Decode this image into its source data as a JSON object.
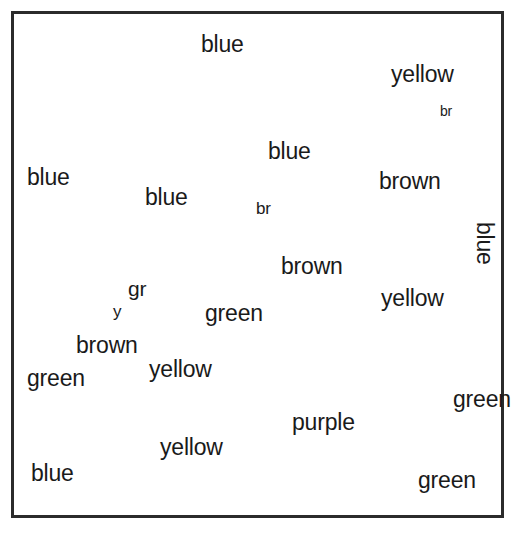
{
  "page": {
    "type": "color-by-word coloring page",
    "background_color": "#ffffff",
    "ink_color": "#1a1a1a",
    "frame_color": "#2b2b2b",
    "width": 529,
    "height": 533
  },
  "labels": [
    {
      "id": "sky-top",
      "text": "blue",
      "x": 201,
      "y": 33,
      "size": "lg",
      "rotated": false
    },
    {
      "id": "hat",
      "text": "yellow",
      "x": 391,
      "y": 63,
      "size": "lg",
      "rotated": false
    },
    {
      "id": "ear",
      "text": "br",
      "x": 440,
      "y": 104,
      "size": "xs",
      "rotated": false
    },
    {
      "id": "sky-head",
      "text": "blue",
      "x": 268,
      "y": 140,
      "size": "lg",
      "rotated": false
    },
    {
      "id": "face",
      "text": "brown",
      "x": 379,
      "y": 170,
      "size": "lg",
      "rotated": false
    },
    {
      "id": "sky-left",
      "text": "blue",
      "x": 27,
      "y": 166,
      "size": "lg",
      "rotated": false
    },
    {
      "id": "sky-mid",
      "text": "blue",
      "x": 145,
      "y": 186,
      "size": "lg",
      "rotated": false
    },
    {
      "id": "flute",
      "text": "br",
      "x": 256,
      "y": 200,
      "size": "sm",
      "rotated": false
    },
    {
      "id": "sky-right",
      "text": "blue",
      "x": 496,
      "y": 222,
      "size": "lg",
      "rotated": true
    },
    {
      "id": "paw-upper",
      "text": "brown",
      "x": 281,
      "y": 255,
      "size": "lg",
      "rotated": false
    },
    {
      "id": "ball-inner",
      "text": "gr",
      "x": 128,
      "y": 278,
      "size": "md",
      "rotated": false
    },
    {
      "id": "ball-core",
      "text": "y",
      "x": 113,
      "y": 303,
      "size": "sm",
      "rotated": false
    },
    {
      "id": "arm",
      "text": "yellow",
      "x": 381,
      "y": 287,
      "size": "lg",
      "rotated": false
    },
    {
      "id": "bush-mid",
      "text": "green",
      "x": 205,
      "y": 302,
      "size": "lg",
      "rotated": false
    },
    {
      "id": "ball-outer",
      "text": "brown",
      "x": 76,
      "y": 334,
      "size": "lg",
      "rotated": false
    },
    {
      "id": "grass-left",
      "text": "green",
      "x": 27,
      "y": 367,
      "size": "lg",
      "rotated": false
    },
    {
      "id": "leg-upper",
      "text": "yellow",
      "x": 149,
      "y": 358,
      "size": "lg",
      "rotated": false
    },
    {
      "id": "grass-right",
      "text": "green",
      "x": 453,
      "y": 388,
      "size": "lg",
      "rotated": false
    },
    {
      "id": "belly",
      "text": "purple",
      "x": 292,
      "y": 411,
      "size": "lg",
      "rotated": false
    },
    {
      "id": "leg-lower",
      "text": "yellow",
      "x": 160,
      "y": 436,
      "size": "lg",
      "rotated": false
    },
    {
      "id": "water",
      "text": "blue",
      "x": 31,
      "y": 462,
      "size": "lg",
      "rotated": false
    },
    {
      "id": "grass-bottom",
      "text": "green",
      "x": 418,
      "y": 469,
      "size": "lg",
      "rotated": false
    }
  ],
  "legend": {
    "colors_used": [
      "blue",
      "yellow",
      "brown",
      "green",
      "purple"
    ],
    "abbreviations": {
      "br": "brown",
      "gr": "green",
      "y": "yellow"
    }
  }
}
